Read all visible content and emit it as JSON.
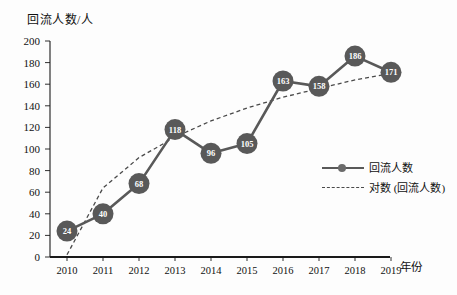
{
  "chart_data": {
    "type": "line",
    "title": "",
    "ylabel": "回流人数/人",
    "xlabel": "年份",
    "categories": [
      "2010",
      "2011",
      "2012",
      "2013",
      "2014",
      "2015",
      "2016",
      "2017",
      "2018",
      "2019"
    ],
    "ylim": [
      0,
      200
    ],
    "ytick_step": 20,
    "yticks": [
      "0",
      "20",
      "40",
      "60",
      "80",
      "100",
      "120",
      "140",
      "160",
      "180",
      "200"
    ],
    "grid": false,
    "legend_position": "inside-right",
    "series": [
      {
        "name": "回流人数",
        "style": "solid-with-markers",
        "color": "#595959",
        "values": [
          24,
          40,
          68,
          118,
          96,
          105,
          163,
          158,
          186,
          171
        ],
        "point_labels": [
          "24",
          "40",
          "68",
          "118",
          "96",
          "105",
          "163",
          "158",
          "186",
          "171"
        ]
      },
      {
        "name": "对数 (回流人数)",
        "style": "dashed-trendline",
        "color": "#4a4a4a",
        "values": [
          2,
          64,
          92,
          111,
          126,
          138,
          148,
          156,
          164,
          170
        ]
      }
    ],
    "legend": [
      {
        "label": "回流人数",
        "style": "solid"
      },
      {
        "label": "对数 (回流人数)",
        "style": "dashed"
      }
    ],
    "colors": {
      "marker_fill": "#595959",
      "marker_label": "#ffffff",
      "line": "#595959",
      "trendline": "#4a4a4a",
      "axis": "#1a1a1a",
      "background": "#fdfdfd"
    }
  }
}
